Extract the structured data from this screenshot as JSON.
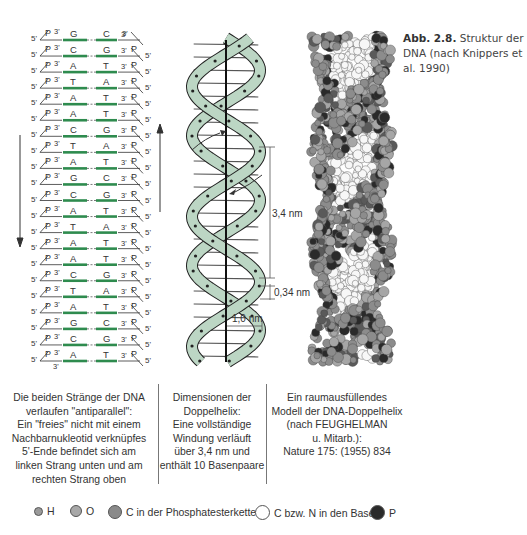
{
  "caption": {
    "label": "Abb. 2.8.",
    "text": "Struktur der DNA (nach Knippers et al. 1990)"
  },
  "ladder": {
    "end_labels": {
      "five_prime": "5'",
      "three_prime": "3'",
      "phosphate": "P"
    },
    "base_pairs": [
      {
        "left": "G",
        "right": "C"
      },
      {
        "left": "C",
        "right": "G"
      },
      {
        "left": "A",
        "right": "T"
      },
      {
        "left": "T",
        "right": "A"
      },
      {
        "left": "A",
        "right": "T"
      },
      {
        "left": "A",
        "right": "T"
      },
      {
        "left": "C",
        "right": "G"
      },
      {
        "left": "T",
        "right": "A"
      },
      {
        "left": "A",
        "right": "T"
      },
      {
        "left": "G",
        "right": "C"
      },
      {
        "left": "C",
        "right": "G"
      },
      {
        "left": "A",
        "right": "T"
      },
      {
        "left": "T",
        "right": "A"
      },
      {
        "left": "A",
        "right": "T"
      },
      {
        "left": "A",
        "right": "T"
      },
      {
        "left": "C",
        "right": "G"
      },
      {
        "left": "T",
        "right": "A"
      },
      {
        "left": "A",
        "right": "T"
      },
      {
        "left": "G",
        "right": "C"
      },
      {
        "left": "C",
        "right": "G"
      },
      {
        "left": "A",
        "right": "T"
      }
    ],
    "bond_color": "#2e8b4e"
  },
  "helix": {
    "pitch_label": "3,4 nm",
    "rise_label": "0,34 nm",
    "radius_label": "1,0 nm",
    "ribbon_color": "#bcd6c4"
  },
  "descriptions": {
    "ladder": [
      "Die beiden Stränge der DNA",
      "verlaufen \"antiparallel\":",
      "Ein \"freies\" nicht mit einem",
      "Nachbarnukleotid verknüpfes",
      "5'-Ende befindet sich am",
      "linken Strang unten und am",
      "rechten Strang oben"
    ],
    "helix": [
      "Dimensionen der",
      "Doppelhelix:",
      "Eine vollständige",
      "Windung verläuft",
      "über 3,4 nm und",
      "enthält 10 Basenpaare"
    ],
    "model": [
      "Ein raumausfüllendes",
      "Modell der DNA-Doppelhelix",
      "(nach FEUGHELMAN",
      "u. Mitarb.):",
      "Nature 175: (1955) 834"
    ]
  },
  "legend": [
    {
      "label": "H",
      "color": "#9a9a9a",
      "size": 7
    },
    {
      "label": "O",
      "color": "#a8a8a8",
      "size": 10
    },
    {
      "label": "C in der Phosphatesterkette",
      "color": "#8a8a8a",
      "size": 12
    },
    {
      "label": "C bzw. N in den Basen",
      "color": "#ffffff",
      "size": 13
    },
    {
      "label": "P",
      "color": "#2a2a2a",
      "size": 13
    }
  ]
}
